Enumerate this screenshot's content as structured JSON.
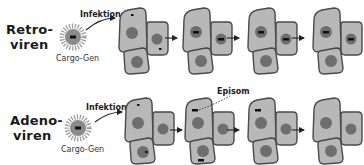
{
  "rows": [
    {
      "id": "retro",
      "title_line1": "Retro-",
      "title_line2": "viren",
      "cargo_label": "Cargo-Gen",
      "infection_label": "Infektion",
      "stages": 4
    },
    {
      "id": "adeno",
      "title_line1": "Adeno-",
      "title_line2": "viren",
      "cargo_label": "Cargo-Gen",
      "infection_label": "Infektion",
      "episome_label": "Episom",
      "stages": 4
    }
  ],
  "colors": {
    "cell_fill": "#b8b8b8",
    "cell_stroke": "#4a4a4a",
    "nucleus": "#6e6e6e",
    "gene": "#111111",
    "virus": "#8a8a8a"
  }
}
